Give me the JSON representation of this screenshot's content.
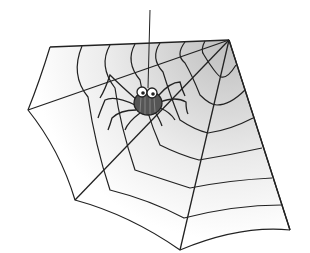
{
  "image": {
    "description": "Cartoon spider hanging from a thread on a corner spider web",
    "subject": "spider",
    "background_color": "#ffffff",
    "line_color": "#222222",
    "web_shade_color": "#b8b8b8"
  }
}
